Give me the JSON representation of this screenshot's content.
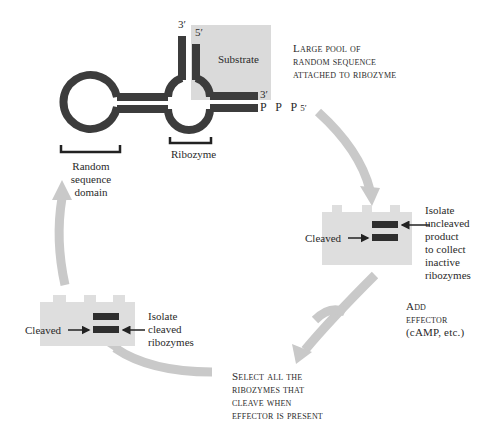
{
  "figure": {
    "colors": {
      "strand": "#3c3c3c",
      "substrate_box": "#dadada",
      "gel": "#dedede",
      "band": "#2e2e2e",
      "cycle_arrow": "#c8c8c8",
      "bracket": "#222222"
    },
    "molecule": {
      "substrate_label": "Substrate",
      "strand_top_left_end": "3′",
      "strand_top_right_end": "5′",
      "substrate_3prime": "3′",
      "triphosphate": "P P P",
      "triphosphate_end": "5′",
      "ribozyme_label": "Ribozyme",
      "random_domain_label": [
        "Random",
        "sequence",
        "domain"
      ]
    },
    "steps": {
      "pool": [
        "Large pool of",
        "random sequence",
        "attached to ribozyme"
      ],
      "isolate_uncleaved": [
        "Isolate",
        "uncleaved",
        "product",
        "to collect",
        "inactive",
        "ribozymes"
      ],
      "add_effector": [
        "Add",
        "effector",
        "(cAMP, etc.)"
      ],
      "select": [
        "Select all the",
        "ribozymes that",
        "cleave when",
        "effector is present"
      ],
      "isolate_cleaved": [
        "Isolate",
        "cleaved",
        "ribozymes"
      ]
    },
    "gels": {
      "right_cleaved_label": "Cleaved",
      "left_cleaved_label": "Cleaved"
    }
  }
}
